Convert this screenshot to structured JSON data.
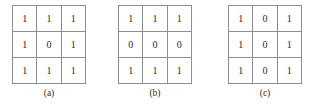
{
  "figure": {
    "type": "binary-matrix-diagram",
    "background_color": "#ffffff",
    "border_color": "#8d8d8d",
    "text_color": "#2b2b2b"
  },
  "panels": [
    {
      "id": "a",
      "caption": "(a)",
      "rows": [
        [
          "1",
          "1",
          "1"
        ],
        [
          "1",
          "0",
          "1"
        ],
        [
          "1",
          "1",
          "1"
        ]
      ]
    },
    {
      "id": "b",
      "caption": "(b)",
      "rows": [
        [
          "1",
          "1",
          "1"
        ],
        [
          "0",
          "0",
          "0"
        ],
        [
          "1",
          "1",
          "1"
        ]
      ]
    },
    {
      "id": "c",
      "caption": "(c)",
      "rows": [
        [
          "1",
          "0",
          "1"
        ],
        [
          "1",
          "0",
          "1"
        ],
        [
          "1",
          "0",
          "1"
        ]
      ]
    }
  ]
}
